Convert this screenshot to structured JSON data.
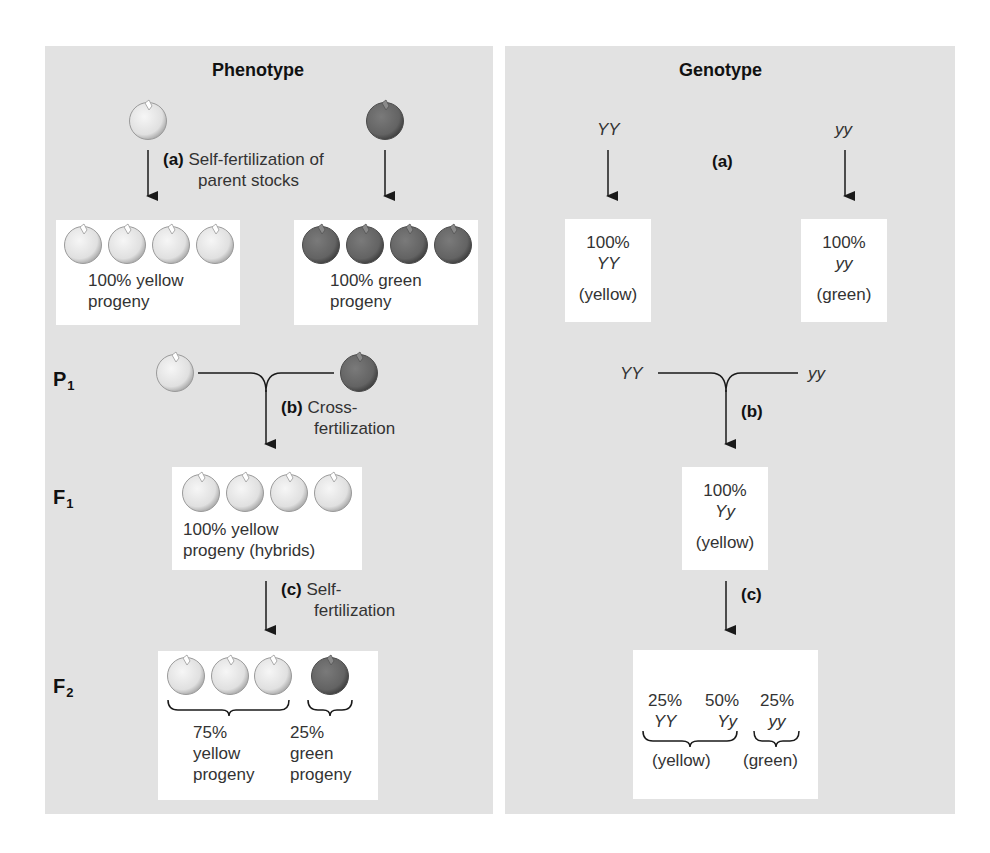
{
  "colors": {
    "panel_bg": "#e2e2e2",
    "box_bg": "#ffffff",
    "yellow_pea": "#e6e6e6",
    "green_pea": "#6a6a6a",
    "line": "#1a1a1a"
  },
  "phenotype": {
    "title": "Phenotype",
    "step_a": {
      "tag": "(a)",
      "text_line1": "Self-fertilization of",
      "text_line2": "parent stocks"
    },
    "yellow_box": {
      "peas": [
        "yellow",
        "yellow",
        "yellow",
        "yellow"
      ],
      "line1": "100% yellow",
      "line2": "progeny"
    },
    "green_box": {
      "peas": [
        "green",
        "green",
        "green",
        "green"
      ],
      "line1": "100% green",
      "line2": "progeny"
    },
    "p1_label": "P",
    "p1_sub": "1",
    "step_b": {
      "tag": "(b)",
      "text_line1": "Cross-",
      "text_line2": "fertilization"
    },
    "f1_label": "F",
    "f1_sub": "1",
    "f1_box": {
      "peas": [
        "yellow",
        "yellow",
        "yellow",
        "yellow"
      ],
      "line1": "100% yellow",
      "line2": "progeny (hybrids)"
    },
    "step_c": {
      "tag": "(c)",
      "text_line1": "Self-",
      "text_line2": "fertilization"
    },
    "f2_label": "F",
    "f2_sub": "2",
    "f2_box": {
      "peas": [
        "yellow",
        "yellow",
        "yellow",
        "green"
      ],
      "yellow_group": {
        "pct": "75%",
        "line1": "yellow",
        "line2": "progeny"
      },
      "green_group": {
        "pct": "25%",
        "line1": "green",
        "line2": "progeny"
      }
    }
  },
  "genotype": {
    "title": "Genotype",
    "parent_left": "YY",
    "parent_right": "yy",
    "step_a_tag": "(a)",
    "box_left": {
      "pct": "100%",
      "geno": "YY",
      "color": "(yellow)"
    },
    "box_right": {
      "pct": "100%",
      "geno": "yy",
      "color": "(green)"
    },
    "cross_left": "YY",
    "cross_right": "yy",
    "step_b_tag": "(b)",
    "f1_box": {
      "pct": "100%",
      "geno": "Yy",
      "color": "(yellow)"
    },
    "step_c_tag": "(c)",
    "f2_box": {
      "items": [
        {
          "pct": "25%",
          "geno": "YY"
        },
        {
          "pct": "50%",
          "geno": "Yy"
        },
        {
          "pct": "25%",
          "geno": "yy"
        }
      ],
      "yellow_label": "(yellow)",
      "green_label": "(green)"
    }
  }
}
